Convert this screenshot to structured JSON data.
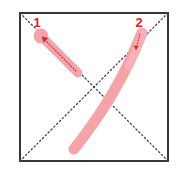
{
  "diagram": {
    "character": "人",
    "stroke_count": 2,
    "frame": {
      "name": "character-grid-box",
      "x": 20,
      "y": 13,
      "width": 148,
      "height": 148,
      "border_color": "#3a3436",
      "border_width": 2,
      "fill_color": "#ffffff"
    },
    "guides": {
      "name": "diagonal-guide-lines",
      "style": "dotted",
      "color": "#4a4446",
      "lines": [
        {
          "name": "guide-diagonal-tl-br",
          "x1": 20,
          "y1": 13,
          "x2": 168,
          "y2": 161
        },
        {
          "name": "guide-diagonal-tr-bl",
          "x1": 168,
          "y1": 13,
          "x2": 20,
          "y2": 161
        }
      ]
    },
    "stroke_color": "#f4a3a8",
    "stroke_color_highlight": "#f7b6ba",
    "arrow_color": "#c4323c",
    "label_color": "#e02020",
    "strokes": [
      {
        "number": "1",
        "name": "stroke-1",
        "type": "pie-left-falling",
        "start": {
          "x": 40,
          "y": 35
        },
        "end": {
          "x": 78,
          "y": 73
        },
        "thickness": 9,
        "has_start_blob": true,
        "label": {
          "x": 37,
          "y": 27
        },
        "direction": "down-right",
        "arrow_points": "up-left"
      },
      {
        "number": "2",
        "name": "stroke-2",
        "type": "na-right-falling-curved",
        "start": {
          "x": 142,
          "y": 33
        },
        "end": {
          "x": 74,
          "y": 149
        },
        "thickness": 11,
        "has_start_blob": false,
        "label": {
          "x": 137,
          "y": 27
        },
        "direction": "down-left",
        "arrow_points": "down"
      }
    ]
  }
}
